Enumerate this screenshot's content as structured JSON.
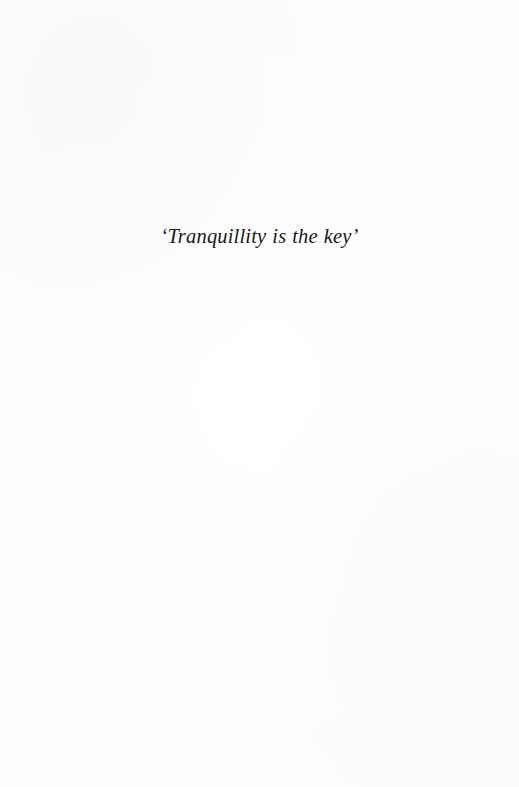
{
  "document": {
    "page_type": "epigraph",
    "background_color": "#fdfdfd",
    "ink_color": "#19181a",
    "epigraph": {
      "text": "‘Tranquillity is the key’",
      "open_quote": "‘",
      "quote_body": "Tranquillity is the key",
      "close_quote": "’",
      "style": "italic-serif",
      "alignment": "center"
    }
  }
}
